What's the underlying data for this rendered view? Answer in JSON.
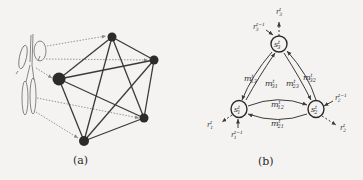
{
  "panel_a": {
    "caption": "(a)",
    "graph_type": "complete graph K5",
    "nodes": [
      {
        "id": "top",
        "x": 112,
        "y": 37,
        "r": 4.5
      },
      {
        "id": "right",
        "x": 154,
        "y": 60,
        "r": 4.5
      },
      {
        "id": "left",
        "x": 59,
        "y": 79,
        "r": 6.5
      },
      {
        "id": "bottom_right",
        "x": 144,
        "y": 118,
        "r": 4.5
      },
      {
        "id": "bottom",
        "x": 84,
        "y": 141,
        "r": 5
      }
    ]
  },
  "panel_b": {
    "caption": "(b)",
    "nodes": [
      {
        "id": "s3",
        "label": "s",
        "sup": "t",
        "sub": "3"
      },
      {
        "id": "s1",
        "label": "s",
        "sup": "t",
        "sub": "1"
      },
      {
        "id": "s2",
        "label": "s",
        "sup": "t",
        "sub": "2"
      }
    ],
    "messages": {
      "m13": "m",
      "m13_sub": "13",
      "m31": "m",
      "m31_sub": "31",
      "m23": "m",
      "m23_sub": "23",
      "m32": "m",
      "m32_sub": "32",
      "m12": "m",
      "m12_sub": "12",
      "m21": "m",
      "m21_sub": "21",
      "sup": "t"
    },
    "observations": {
      "r": "r",
      "sup_t": "t",
      "sup_prev": "t−1",
      "sub1": "1",
      "sub2": "2",
      "sub3": "3"
    }
  }
}
